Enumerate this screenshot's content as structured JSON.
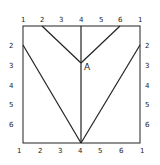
{
  "diagram": {
    "point_label": "A",
    "top_labels": [
      "1",
      "2",
      "3",
      "4",
      "5",
      "6",
      "1"
    ],
    "bottom_labels": [
      "1",
      "2",
      "3",
      "4",
      "5",
      "6",
      "1"
    ],
    "left_labels": [
      "2",
      "3",
      "4",
      "5",
      "6"
    ],
    "right_labels": [
      "2",
      "3",
      "4",
      "5",
      "6"
    ],
    "stroke_color": "#222222"
  }
}
